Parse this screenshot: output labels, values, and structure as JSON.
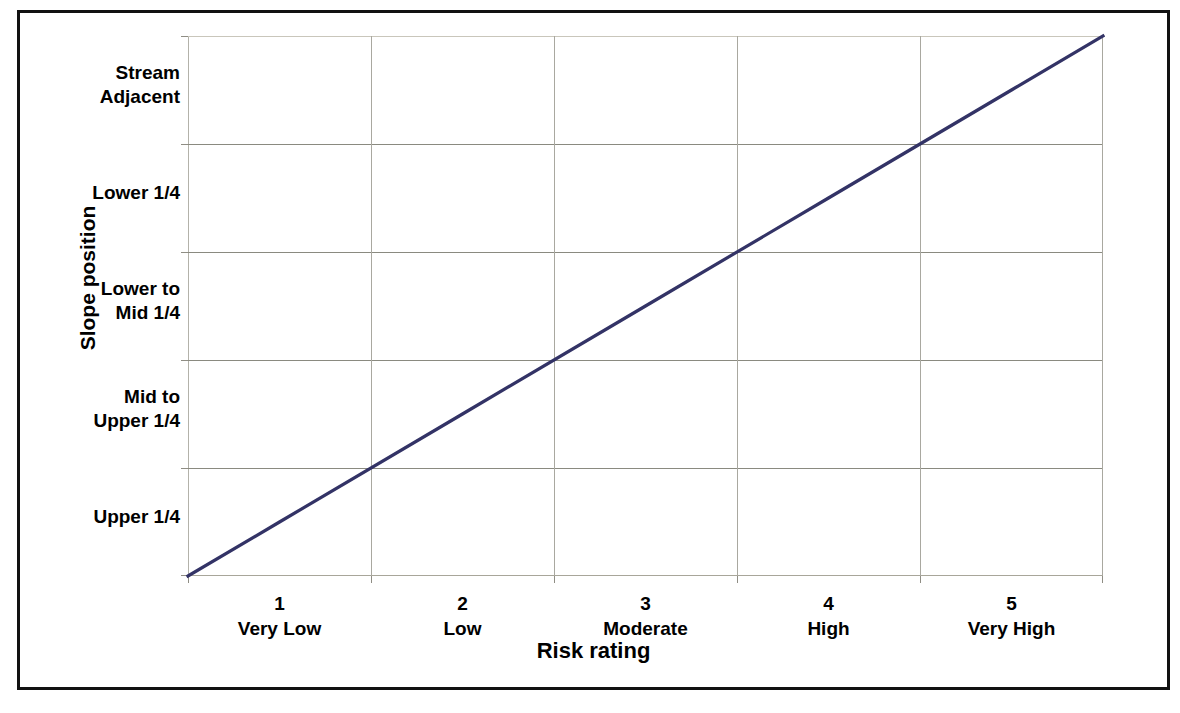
{
  "chart_data": {
    "type": "line",
    "title": "",
    "xlabel": "Risk rating",
    "ylabel": "Slope position",
    "grid": true,
    "legend": null,
    "x_ticks": [
      {
        "number": "1",
        "category": "Very Low"
      },
      {
        "number": "2",
        "category": "Low"
      },
      {
        "number": "3",
        "category": "Moderate"
      },
      {
        "number": "4",
        "category": "High"
      },
      {
        "number": "5",
        "category": "Very High"
      }
    ],
    "y_ticks": [
      "Stream Adjacent",
      "Lower 1/4",
      "Lower to Mid 1/4",
      "Mid to Upper 1/4",
      "Upper 1/4"
    ],
    "y_tick_lines": [
      [
        "Stream",
        "Adjacent"
      ],
      [
        "Lower 1/4"
      ],
      [
        "Lower to",
        "Mid 1/4"
      ],
      [
        "Mid to",
        "Upper 1/4"
      ],
      [
        "Upper 1/4"
      ]
    ],
    "categories": [
      "Very Low",
      "Low",
      "Moderate",
      "High",
      "Very High"
    ],
    "x": [
      1,
      2,
      3,
      4,
      5
    ],
    "values": [
      1,
      2,
      3,
      4,
      5
    ],
    "series": [
      {
        "name": "Risk vs slope position",
        "color": "#333366",
        "points": [
          {
            "x": 0.5,
            "y": 0.0,
            "x_label": "",
            "y_label": ""
          },
          {
            "x": 1.0,
            "y": 0.5,
            "x_label": "Very Low",
            "y_label": "Upper 1/4"
          },
          {
            "x": 2.0,
            "y": 1.5,
            "x_label": "Low",
            "y_label": "Mid to Upper 1/4"
          },
          {
            "x": 3.0,
            "y": 2.5,
            "x_label": "Moderate",
            "y_label": "Lower to Mid 1/4"
          },
          {
            "x": 4.0,
            "y": 3.5,
            "x_label": "High",
            "y_label": "Lower 1/4"
          },
          {
            "x": 5.0,
            "y": 4.5,
            "x_label": "Very High",
            "y_label": "Stream Adjacent"
          },
          {
            "x": 5.5,
            "y": 5.0,
            "x_label": "",
            "y_label": ""
          }
        ]
      }
    ],
    "xlim": [
      0.5,
      5.5
    ],
    "ylim": [
      0,
      5
    ]
  },
  "colors": {
    "series_line": "#333366",
    "gridline": "#9a978c",
    "axis": "#a8a69a",
    "frame_border": "#111111",
    "text": "#000000",
    "background": "#ffffff"
  }
}
